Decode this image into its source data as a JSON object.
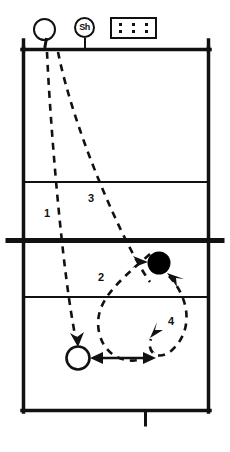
{
  "diagram": {
    "colors": {
      "line": "#111111",
      "fill_ball": "#000000",
      "background": "#ffffff"
    }
  },
  "legend": {
    "player_marker": {
      "icon": "open-circle-player-icon",
      "label": ""
    },
    "shagger_marker": {
      "icon": "sh-circle-icon",
      "label": "Sh"
    },
    "ball_cart": {
      "icon": "ball-cart-icon",
      "dots": 6
    }
  },
  "court": {
    "left": 22,
    "right": 210,
    "top": 48,
    "bottom": 412,
    "net_y": 240,
    "attack_line_top_y": 182,
    "attack_line_bottom_y": 297,
    "center_mark_x": 145
  },
  "path_labels": [
    {
      "id": "1",
      "text": "1",
      "x": 46,
      "y": 213
    },
    {
      "id": "2",
      "text": "2",
      "x": 100,
      "y": 277
    },
    {
      "id": "3",
      "text": "3",
      "x": 90,
      "y": 198
    },
    {
      "id": "4",
      "text": "4",
      "x": 170,
      "y": 320
    }
  ],
  "markers": {
    "ball": {
      "name": "filled-ball-marker",
      "cx": 159,
      "cy": 263,
      "r": 11
    },
    "player": {
      "name": "open-circle-player-marker",
      "cx": 78,
      "cy": 358,
      "r": 12
    }
  },
  "paths": {
    "serve_1": "M 47,50 C 50,120 62,270 78,340",
    "serve_3": "M 57,50 C 70,130 120,250 150,280",
    "pass_2": "M 152,255 C 120,280 95,300 100,330 C 106,362 140,368 155,352",
    "loop_4": "M 168,276 C 190,300 192,330 170,350 C 155,362 145,350 150,338"
  },
  "arrows": [
    {
      "name": "arrow-into-ball-left",
      "at": [
        146,
        262
      ],
      "dir": "right"
    },
    {
      "name": "arrow-into-ball-lower-right",
      "at": [
        168,
        272
      ],
      "dir": "upleft"
    },
    {
      "name": "arrow-into-player-top",
      "at": [
        78,
        344
      ],
      "dir": "down"
    },
    {
      "name": "arrow-double-player-right",
      "from": [
        92,
        358
      ],
      "to": [
        152,
        358
      ]
    },
    {
      "name": "arrow-into-loop-left",
      "at": [
        151,
        337
      ],
      "dir": "downleft"
    }
  ]
}
